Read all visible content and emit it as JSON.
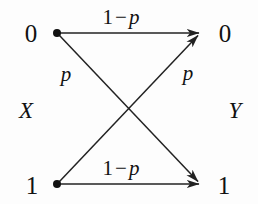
{
  "diagram": {
    "type": "binary-symmetric-channel",
    "colors": {
      "background": "#fdfdfd",
      "stroke": "#222222",
      "text": "#111111",
      "node_fill": "#111111"
    },
    "input_variable": "X",
    "output_variable": "Y",
    "input_nodes": [
      {
        "id": "x0",
        "label": "0",
        "x": 57,
        "y": 33,
        "label_x": 31,
        "label_y": 33
      },
      {
        "id": "x1",
        "label": "1",
        "x": 57,
        "y": 184,
        "label_x": 32,
        "label_y": 185
      }
    ],
    "output_nodes": [
      {
        "id": "y0",
        "label": "0",
        "x": 201,
        "y": 33,
        "label_x": 225,
        "label_y": 33
      },
      {
        "id": "y1",
        "label": "1",
        "x": 201,
        "y": 184,
        "label_x": 224,
        "label_y": 185
      }
    ],
    "edges": [
      {
        "id": "e-00",
        "from": "x0",
        "to": "y0",
        "label_prefix": "1",
        "label_operator": "−",
        "label_symbol": "p",
        "label_full": "1 − p",
        "label_x": 121,
        "label_y": 17
      },
      {
        "id": "e-01",
        "from": "x0",
        "to": "y1",
        "label_prefix": "",
        "label_operator": "",
        "label_symbol": "p",
        "label_full": "p",
        "label_x": 66,
        "label_y": 74
      },
      {
        "id": "e-10",
        "from": "x1",
        "to": "y0",
        "label_prefix": "",
        "label_operator": "",
        "label_symbol": "p",
        "label_full": "p",
        "label_x": 188,
        "label_y": 73
      },
      {
        "id": "e-11",
        "from": "x1",
        "to": "y1",
        "label_prefix": "1",
        "label_operator": "−",
        "label_symbol": "p",
        "label_full": "1 − p",
        "label_x": 121,
        "label_y": 168
      }
    ],
    "variable_labels": [
      {
        "id": "var-x",
        "text": "X",
        "x": 26,
        "y": 110
      },
      {
        "id": "var-y",
        "text": "Y",
        "x": 235,
        "y": 110
      }
    ],
    "crossing_point": {
      "x": 129,
      "y": 109
    }
  }
}
